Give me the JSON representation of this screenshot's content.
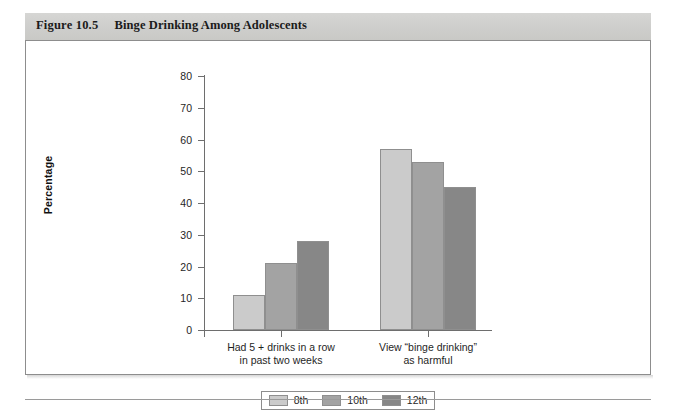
{
  "figure": {
    "number": "Figure 10.5",
    "title": "Binge Drinking Among Adolescents"
  },
  "chart_data": {
    "type": "bar",
    "title": "Binge Drinking Among Adolescents",
    "xlabel": "",
    "ylabel": "Percentage",
    "ylim": [
      0,
      80
    ],
    "yticks": [
      0,
      10,
      20,
      30,
      40,
      50,
      60,
      70,
      80
    ],
    "grid": false,
    "legend_position": "bottom-center",
    "categories": [
      "Had 5 + drinks in a row in past two weeks",
      "View “binge drinking” as harmful"
    ],
    "category_lines": [
      [
        "Had 5 + drinks in a row",
        "in past two weeks"
      ],
      [
        "View “binge drinking”",
        "as harmful"
      ]
    ],
    "series": [
      {
        "name": "8th",
        "color": "#cbcbcb",
        "values": [
          11,
          57
        ]
      },
      {
        "name": "10th",
        "color": "#a3a3a3",
        "values": [
          21,
          53
        ]
      },
      {
        "name": "12th",
        "color": "#878787",
        "values": [
          28,
          45
        ]
      }
    ]
  },
  "legend": {
    "items": [
      {
        "label": "8th",
        "color": "#cbcbcb"
      },
      {
        "label": "10th",
        "color": "#a3a3a3"
      },
      {
        "label": "12th",
        "color": "#878787"
      }
    ]
  },
  "axis": {
    "y_title": "Percentage",
    "y_tick_labels": [
      "0",
      "10",
      "20",
      "30",
      "40",
      "50",
      "60",
      "70",
      "80"
    ]
  }
}
